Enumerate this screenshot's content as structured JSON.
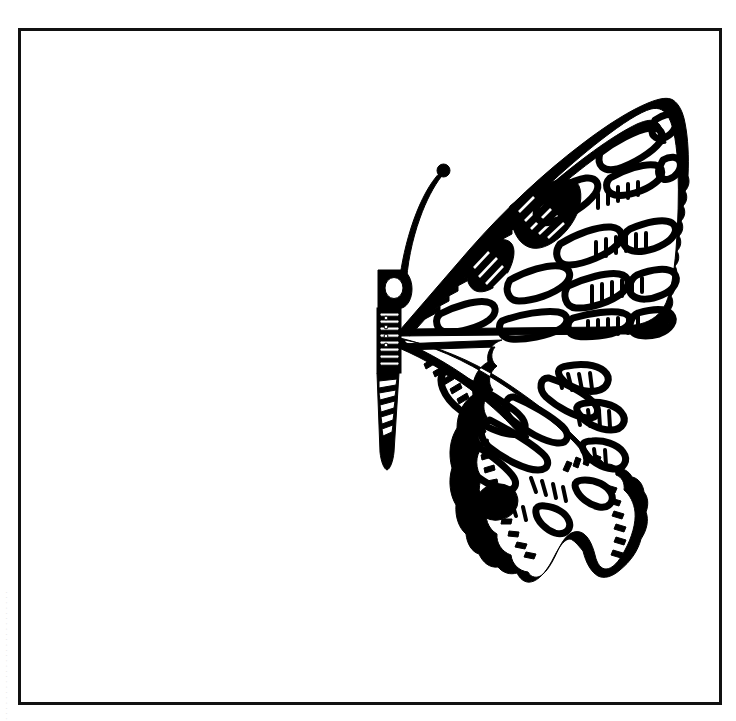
{
  "page": {
    "background_color": "#ffffff",
    "width": 736,
    "height": 721
  },
  "frame": {
    "name": "illustration-border",
    "stroke_color": "#111111",
    "stroke_width": 3,
    "x": 18,
    "y": 28,
    "width": 704,
    "height": 677
  },
  "illustration": {
    "subject": "swallowtail-butterfly-half-profile",
    "style": "black-and-white line art, coloring book outline",
    "ink_color": "#000000",
    "fill_color": "#ffffff",
    "orientation": "right-facing half butterfly, body along left, wings spread to the right",
    "parts": [
      {
        "name": "antenna",
        "description": "long curved antenna rising up-right with clubbed tip"
      },
      {
        "name": "head-eye",
        "description": "round white eye circle on solid black head"
      },
      {
        "name": "thorax",
        "description": "black thorax with horizontal white stripes"
      },
      {
        "name": "abdomen",
        "description": "tapering abdomen with diagonal black and white bands"
      },
      {
        "name": "forewing",
        "description": "upper wing with elongated cells, hatched vein marks and dark patch near base"
      },
      {
        "name": "hindwing",
        "description": "lower wing with scalloped margin, cells, hatching and a tail"
      },
      {
        "name": "eyespot",
        "description": "solid black oval spot on the hindwing"
      },
      {
        "name": "wing-tail",
        "description": "swallowtail extension from hindwing lower margin"
      }
    ]
  },
  "edge_artifact": {
    "text": "· · ·   · · ·   · · ·   ·   · ·   · · · ·   · ·   ·   · · ·   ·   · ·",
    "description": "faint illegible scanner marks along left page edge"
  }
}
